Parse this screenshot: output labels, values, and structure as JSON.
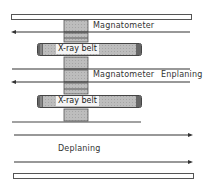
{
  "diagram": {
    "labels": {
      "magnetometer_top": "Magnatometer",
      "magnetometer_mid": "Magnatometer",
      "enplaning": "Enplaning",
      "deplaning": "Deplaning",
      "belt_top": "X-ray belt",
      "belt_bottom": "X-ray belt"
    },
    "flows": [
      {
        "name": "enplaning-upper",
        "direction": "left"
      },
      {
        "name": "enplaning-lower",
        "direction": "left"
      },
      {
        "name": "deplaning-upper",
        "direction": "right"
      },
      {
        "name": "deplaning-lower",
        "direction": "right"
      }
    ],
    "colors": {
      "line": "#333333",
      "block_fill": "#b8b8b8",
      "belt_fill": "#c4c4c4",
      "wall_fill": "#ffffff"
    }
  }
}
